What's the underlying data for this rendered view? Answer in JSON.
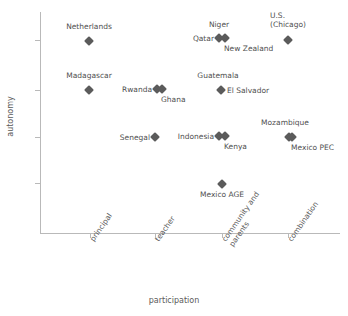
{
  "chart_data": {
    "type": "scatter",
    "title": "",
    "xlabel": "participation",
    "ylabel": "autonomy",
    "grid": false,
    "legend": "none",
    "x_tick_labels": [
      "principal",
      "teacher",
      "community and\nparents",
      "combination"
    ],
    "x_tick_values": [
      1,
      2,
      3,
      4
    ],
    "y_tick_labels": [
      "",
      "",
      "",
      ""
    ],
    "y_tick_values": [
      4,
      3,
      2,
      1
    ],
    "xlim": [
      0.5,
      4.8
    ],
    "ylim": [
      0.4,
      4.6
    ],
    "marker_shape": "diamond",
    "marker_color": "#5b5b5b",
    "axis_color": "#b9b9b9",
    "points": [
      {
        "label": "Netherlands",
        "x": 1,
        "y": 4,
        "px": 89,
        "py": 41,
        "label_px": 89,
        "label_py": 31,
        "place": "above"
      },
      {
        "label": "Niger",
        "x": 3,
        "y": 4,
        "px": 219,
        "py": 38,
        "label_px": 219,
        "label_py": 29,
        "place": "above"
      },
      {
        "label": "Qatar",
        "x": 3,
        "y": 4,
        "px": 219,
        "py": 38,
        "label_px": 214,
        "label_py": 38,
        "place": "left"
      },
      {
        "label": "New Zealand",
        "x": 3,
        "y": 4,
        "px": 225,
        "py": 38,
        "label_px": 224,
        "label_py": 44,
        "place": "below-right"
      },
      {
        "label": "U.S.\n(Chicago)",
        "x": 4,
        "y": 4,
        "px": 288,
        "py": 40,
        "label_px": 288,
        "label_py": 29,
        "place": "above"
      },
      {
        "label": "Madagascar",
        "x": 1,
        "y": 3,
        "px": 89,
        "py": 90,
        "label_px": 89,
        "label_py": 80,
        "place": "above"
      },
      {
        "label": "Rwanda",
        "x": 2,
        "y": 3,
        "px": 157,
        "py": 89,
        "label_px": 152,
        "label_py": 89,
        "place": "left"
      },
      {
        "label": "Ghana",
        "x": 2,
        "y": 3,
        "px": 162,
        "py": 89,
        "label_px": 161,
        "label_py": 95,
        "place": "below-right"
      },
      {
        "label": "Guatemala",
        "x": 3,
        "y": 3,
        "px": 221,
        "py": 90,
        "label_px": 218,
        "label_py": 80,
        "place": "above"
      },
      {
        "label": "El Salvador",
        "x": 3,
        "y": 3,
        "px": 221,
        "py": 90,
        "label_px": 227,
        "label_py": 90,
        "place": "right"
      },
      {
        "label": "Senegal",
        "x": 2,
        "y": 2,
        "px": 155,
        "py": 137,
        "label_px": 150,
        "label_py": 137,
        "place": "left"
      },
      {
        "label": "Indonesia",
        "x": 3,
        "y": 2,
        "px": 219,
        "py": 136,
        "label_px": 214,
        "label_py": 136,
        "place": "left"
      },
      {
        "label": "Kenya",
        "x": 3,
        "y": 2,
        "px": 225,
        "py": 136,
        "label_px": 224,
        "label_py": 142,
        "place": "below-right"
      },
      {
        "label": "Mozambique",
        "x": 4,
        "y": 2,
        "px": 289,
        "py": 137,
        "label_px": 285,
        "label_py": 127,
        "place": "above"
      },
      {
        "label": "Mexico PEC",
        "x": 4,
        "y": 2,
        "px": 292,
        "py": 137,
        "label_px": 291,
        "label_py": 143,
        "place": "below-right"
      },
      {
        "label": "Mexico AGE",
        "x": 3,
        "y": 1,
        "px": 222,
        "py": 184,
        "label_px": 222,
        "label_py": 190,
        "place": "below"
      }
    ]
  },
  "axes": {
    "y_ticks_px": [
      40,
      90,
      137,
      183
    ],
    "x_ticks_px": [
      90,
      155,
      222,
      288
    ]
  }
}
